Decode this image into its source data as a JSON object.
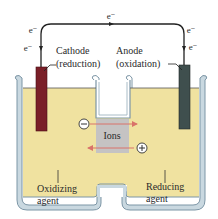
{
  "diagram": {
    "electron_label": "e⁻",
    "electron_labels": [
      {
        "id": "top",
        "text": "e⁻",
        "x": 111,
        "y": 18
      },
      {
        "id": "left-upper",
        "text": "e⁻",
        "x": 32,
        "y": 32
      },
      {
        "id": "left-lower",
        "text": "e⁻",
        "x": 27,
        "y": 50
      },
      {
        "id": "right-upper",
        "text": "e⁻",
        "x": 190,
        "y": 32
      },
      {
        "id": "right-lower",
        "text": "e⁻",
        "x": 192,
        "y": 49
      }
    ],
    "cathode": {
      "line1": "Cathode",
      "line2": "(reduction)",
      "color": "#7a1f28"
    },
    "anode": {
      "line1": "Anode",
      "line2": "(oxidation)",
      "color": "#3f4f4e"
    },
    "ions_label": "Ions",
    "negative_ion_symbol": "⊖",
    "positive_ion_symbol": "⊕",
    "left_solution": {
      "line1": "Oxidizing",
      "line2": "agent"
    },
    "right_solution": {
      "line1": "Reducing",
      "line2": "agent"
    },
    "colors": {
      "solution": "#f0e2a0",
      "container_edge": "#8fa9b8",
      "container_fill": "#c9d8e0",
      "salt_bridge": "#c5c3c3",
      "ion_arrow": "#d9736a",
      "wire": "#222222"
    }
  }
}
